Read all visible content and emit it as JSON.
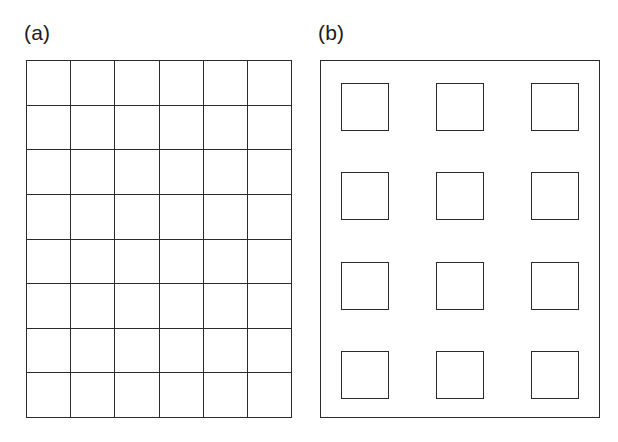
{
  "figure": {
    "background_color": "#ffffff",
    "stroke_color": "#2b2b2b",
    "width": 618,
    "height": 442
  },
  "panels": [
    {
      "id": "a",
      "label": "(a)",
      "type": "contiguous-grid",
      "columns": 6,
      "rows": 8,
      "cell_count": 48,
      "bounds": {
        "x": 26,
        "y": 60,
        "width": 266,
        "height": 358
      },
      "cell_size": {
        "width": 44.3,
        "height": 44.8
      },
      "has_outer_border": true,
      "gap": 0
    },
    {
      "id": "b",
      "label": "(b)",
      "type": "detached-square-array",
      "columns": 3,
      "rows": 4,
      "square_count": 12,
      "bounds": {
        "x": 320,
        "y": 60,
        "width": 280,
        "height": 358
      },
      "square_size": {
        "width": 48,
        "height": 48
      },
      "column_gap": 42,
      "row_gap": 44,
      "inner_margin": {
        "left": 20,
        "top": 22,
        "right": 20,
        "bottom": 18
      },
      "has_outer_border": true
    }
  ],
  "chart_data": {
    "type": "diagram",
    "title": "",
    "subtitle": "",
    "xlabel": "",
    "ylabel": "",
    "legend": [],
    "annotations": [
      "(a)",
      "(b)"
    ],
    "series": [
      {
        "name": "(a) contiguous grid",
        "columns": 6,
        "rows": 8,
        "values": [
          48
        ]
      },
      {
        "name": "(b) detached squares",
        "columns": 3,
        "rows": 4,
        "values": [
          12
        ]
      }
    ]
  }
}
